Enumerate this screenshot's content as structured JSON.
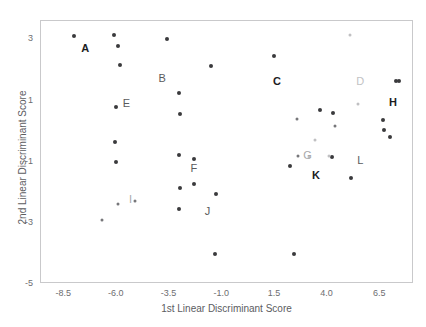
{
  "chart_data": {
    "type": "scatter",
    "title": "",
    "xlabel": "1st Linear Discriminant Score",
    "ylabel": "2nd Linear Discriminant Score",
    "xlim": [
      -9.6,
      8.1
    ],
    "ylim": [
      -5.0,
      3.6
    ],
    "xticks": [
      "-8.5",
      "-6.0",
      "-3.5",
      "-1.0",
      "1.5",
      "4.0",
      "6.5"
    ],
    "xtick_values": [
      -8.5,
      -6.0,
      -3.5,
      -1.0,
      1.5,
      4.0,
      6.5
    ],
    "yticks": [
      "3",
      "1",
      "-1",
      "-3",
      "-5"
    ],
    "ytick_values": [
      3,
      1,
      -1,
      -3,
      -5
    ],
    "grid": false,
    "legend": "none",
    "annotations": [
      {
        "text": "A",
        "x": -7.5,
        "y": 2.72,
        "style": "bold"
      },
      {
        "text": "B",
        "x": -3.85,
        "y": 1.72,
        "style": "norm"
      },
      {
        "text": "C",
        "x": 1.6,
        "y": 1.63,
        "style": "bold"
      },
      {
        "text": "D",
        "x": 5.55,
        "y": 1.63,
        "style": "lightl"
      },
      {
        "text": "E",
        "x": -5.55,
        "y": 0.93,
        "style": "norm"
      },
      {
        "text": "F",
        "x": -2.35,
        "y": -1.22,
        "style": "norm"
      },
      {
        "text": "G",
        "x": 3.05,
        "y": -0.78,
        "style": "midl"
      },
      {
        "text": "H",
        "x": 7.1,
        "y": 0.95,
        "style": "bold"
      },
      {
        "text": "I",
        "x": -5.35,
        "y": -2.22,
        "style": "midl"
      },
      {
        "text": "J",
        "x": -1.7,
        "y": -2.62,
        "style": "norm"
      },
      {
        "text": "K",
        "x": 3.45,
        "y": -1.42,
        "style": "bold"
      },
      {
        "text": "L",
        "x": 5.55,
        "y": -0.95,
        "style": "norm"
      }
    ],
    "series": [
      {
        "name": "dark-points",
        "color": "#3a3a3d",
        "points": [
          {
            "x": -8.05,
            "y": 3.12
          },
          {
            "x": -6.15,
            "y": 3.13
          },
          {
            "x": -5.95,
            "y": 2.79
          },
          {
            "x": -5.85,
            "y": 2.15
          },
          {
            "x": -6.05,
            "y": 0.8
          },
          {
            "x": -6.1,
            "y": -0.35
          },
          {
            "x": -6.05,
            "y": -1.0
          },
          {
            "x": -3.6,
            "y": 3.02
          },
          {
            "x": -3.05,
            "y": 1.25
          },
          {
            "x": -3.0,
            "y": 0.55
          },
          {
            "x": -3.05,
            "y": -0.78
          },
          {
            "x": -2.35,
            "y": -0.92
          },
          {
            "x": -3.0,
            "y": -1.87
          },
          {
            "x": -2.35,
            "y": -1.72
          },
          {
            "x": -3.05,
            "y": -2.55
          },
          {
            "x": -1.3,
            "y": -2.07
          },
          {
            "x": -1.55,
            "y": 2.12
          },
          {
            "x": -1.35,
            "y": -4.02
          },
          {
            "x": 1.45,
            "y": 2.45
          },
          {
            "x": 2.4,
            "y": -4.03
          },
          {
            "x": 2.2,
            "y": -1.13
          },
          {
            "x": 3.65,
            "y": 0.68
          },
          {
            "x": 4.25,
            "y": 0.58
          },
          {
            "x": 4.2,
            "y": -0.85
          },
          {
            "x": 5.1,
            "y": -1.55
          },
          {
            "x": 6.65,
            "y": 0.35
          },
          {
            "x": 6.7,
            "y": 0.05
          },
          {
            "x": 6.95,
            "y": -0.2
          },
          {
            "x": 7.25,
            "y": 1.65
          },
          {
            "x": 7.4,
            "y": 1.63
          }
        ]
      },
      {
        "name": "mid-points",
        "color": "#77777a",
        "points": [
          {
            "x": -6.7,
            "y": -2.92
          },
          {
            "x": -5.95,
            "y": -2.4
          },
          {
            "x": -5.15,
            "y": -2.28
          },
          {
            "x": 2.55,
            "y": 0.4
          },
          {
            "x": 2.6,
            "y": -0.82
          },
          {
            "x": 4.35,
            "y": 0.18
          }
        ]
      },
      {
        "name": "light-points",
        "color": "#c0c0c2",
        "points": [
          {
            "x": 5.05,
            "y": 3.15
          },
          {
            "x": 5.45,
            "y": 0.9
          },
          {
            "x": 3.4,
            "y": -0.3
          },
          {
            "x": 3.1,
            "y": -0.85
          },
          {
            "x": 4.05,
            "y": -0.8
          }
        ]
      }
    ]
  }
}
